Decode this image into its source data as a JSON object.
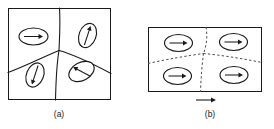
{
  "figure": {
    "background_color": "#ffffff",
    "line_color": "#1a1a1a",
    "dashed_wall_color": "#4d4d4d",
    "width": 274,
    "height": 129
  },
  "panels": [
    {
      "id": "a",
      "caption": "(a)",
      "caption_x": 59,
      "caption_y": 115,
      "frame": {
        "x": 8,
        "y": 8,
        "width": 103,
        "height": 92
      },
      "wall_style": "solid",
      "description": "Randomly oriented magnetic domains separated by solid domain walls",
      "walls": [
        "M 59.5 8 C 60.5 24 59.5 38 59.0 50.5",
        "M 8 72.5 C 26 66 44 56.5 59.0 50.5",
        "M 59.0 50.5 C 76 55 95 65 111 73.5",
        "M 59.0 50.5 C 57 62 56 78 55.5 100"
      ],
      "domains": [
        {
          "name": "domain-upper-left",
          "cx": 33.5,
          "cy": 36.5,
          "rx": 14.5,
          "ry": 8.5,
          "rotate": 0,
          "arrow_angle_deg": 0,
          "arrow_direction": "right",
          "arrow_length": 19
        },
        {
          "name": "domain-upper-right",
          "cx": 87.5,
          "cy": 35.5,
          "rx": 8.5,
          "ry": 12.5,
          "rotate": 20,
          "arrow_angle_deg": -72,
          "arrow_direction": "up-right",
          "arrow_length": 20
        },
        {
          "name": "domain-lower-left",
          "cx": 35.0,
          "cy": 75.0,
          "rx": 8.5,
          "ry": 12.5,
          "rotate": 22,
          "arrow_angle_deg": 108,
          "arrow_direction": "down-left",
          "arrow_length": 20
        },
        {
          "name": "domain-lower-right",
          "cx": 81.5,
          "cy": 71.5,
          "rx": 13.5,
          "ry": 9.0,
          "rotate": -28,
          "arrow_angle_deg": 208,
          "arrow_direction": "up-left",
          "arrow_length": 19
        }
      ]
    },
    {
      "id": "b",
      "caption": "(b)",
      "caption_x": 210,
      "caption_y": 115,
      "frame": {
        "x": 148,
        "y": 27,
        "width": 114,
        "height": 65
      },
      "wall_style": "dashed",
      "description": "Domains aligned with the applied magnetic field; domain walls shown dashed",
      "walls": [
        "M 206 27 C 207.5 36 207 44 203.5 53.5",
        "M 148 63.5 C 168 59 189 55.5 203.5 53.5",
        "M 203.5 53.5 C 220 55 242 58.5 262 62.5",
        "M 203.5 53.5 C 202 65 201 78 200.5 92"
      ],
      "domains": [
        {
          "name": "domain-upper-left",
          "cx": 178.5,
          "cy": 43.0,
          "rx": 14.0,
          "ry": 8.5,
          "rotate": 0,
          "arrow_angle_deg": 0,
          "arrow_direction": "right",
          "arrow_length": 18
        },
        {
          "name": "domain-upper-right",
          "cx": 233.5,
          "cy": 42.0,
          "rx": 14.0,
          "ry": 8.5,
          "rotate": 0,
          "arrow_angle_deg": 0,
          "arrow_direction": "right",
          "arrow_length": 18
        },
        {
          "name": "domain-lower-left",
          "cx": 177.5,
          "cy": 76.0,
          "rx": 14.0,
          "ry": 8.5,
          "rotate": 0,
          "arrow_angle_deg": 0,
          "arrow_direction": "right",
          "arrow_length": 18
        },
        {
          "name": "domain-lower-right",
          "cx": 234.0,
          "cy": 75.0,
          "rx": 14.0,
          "ry": 8.5,
          "rotate": 0,
          "arrow_angle_deg": 0,
          "arrow_direction": "right",
          "arrow_length": 18
        }
      ],
      "field_arrow": {
        "name": "applied-field-arrow",
        "x1": 196,
        "y1": 100,
        "x2": 216,
        "y2": 100,
        "direction": "right",
        "label": ""
      }
    }
  ]
}
